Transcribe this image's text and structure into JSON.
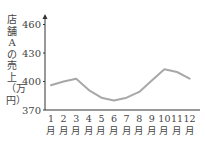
{
  "chart_data": {
    "type": "line",
    "title": "",
    "xlabel": "",
    "ylabel": "店舗Aの売上（万円）",
    "categories": [
      "1月",
      "2月",
      "3月",
      "4月",
      "5月",
      "6月",
      "7月",
      "8月",
      "9月",
      "10月",
      "11月",
      "12月"
    ],
    "x_ticks": [
      "1",
      "2",
      "3",
      "4",
      "5",
      "6",
      "7",
      "8",
      "9",
      "10",
      "11",
      "12"
    ],
    "x_tick_suffix": "月",
    "y_ticks": [
      370,
      400,
      430,
      460
    ],
    "ylim": [
      370,
      470
    ],
    "grid": false,
    "series": [
      {
        "name": "店舗Aの売上",
        "color": "#a8a8a8",
        "values": [
          396,
          400,
          403,
          391,
          383,
          380,
          383,
          389,
          401,
          413,
          410,
          403
        ]
      }
    ]
  }
}
